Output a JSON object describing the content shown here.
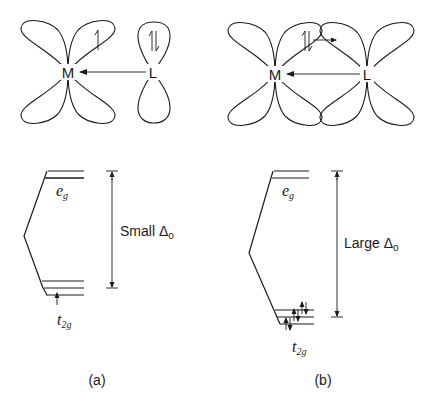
{
  "panels": [
    {
      "id": "a",
      "caption": "(a)",
      "orbital": {
        "metal_label": "M",
        "ligand_label": "L",
        "metal_electron": "↿",
        "ligand_electrons": "⇃↾",
        "ligand_orbital_type": "p (sigma donor)",
        "arrow": "L → M sigma donation"
      },
      "energy": {
        "upper_label": "e",
        "upper_sub": "g",
        "lower_label": "t",
        "lower_sub": "2g",
        "delta_label": "Small Δ",
        "delta_sub": "o",
        "t2g_electrons": "↑"
      }
    },
    {
      "id": "b",
      "caption": "(b)",
      "orbital": {
        "metal_label": "M",
        "ligand_label": "L",
        "metal_electrons": "⇃↾",
        "pi_arrow": "M → L pi back-donation",
        "arrow": "L → M sigma donation"
      },
      "energy": {
        "upper_label": "e",
        "upper_sub": "g",
        "lower_label": "t",
        "lower_sub": "2g",
        "delta_label": "Large Δ",
        "delta_sub": "o",
        "t2g_electrons": "↑↓ ↑↓ ↑↓"
      }
    }
  ],
  "colors": {
    "stroke": "#1a1a1a",
    "background": "#ffffff"
  }
}
